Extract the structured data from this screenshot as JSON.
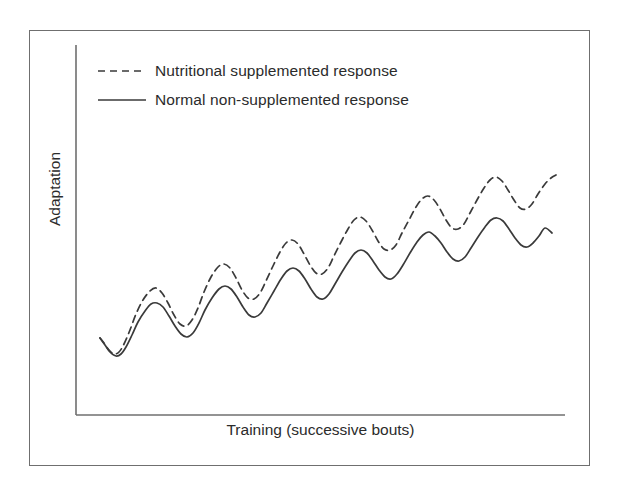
{
  "figure": {
    "border_color": "#6f6f6f",
    "background": "#ffffff"
  },
  "axes": {
    "line_color": "#6f6f6f",
    "x_label": "Training (successive bouts)",
    "y_label": "Adaptation"
  },
  "legend": {
    "entries": [
      {
        "label": "Nutritional supplemented response",
        "style": "dashed"
      },
      {
        "label": "Normal non-supplemented response",
        "style": "solid"
      }
    ]
  },
  "chart_data": {
    "type": "line",
    "title": "",
    "xlabel": "Training (successive bouts)",
    "ylabel": "Adaptation",
    "xlim": [
      0,
      100
    ],
    "ylim": [
      0,
      100
    ],
    "grid": false,
    "axis_ticks": false,
    "legend_position": "top-left",
    "line_color": "#3a3a3a",
    "series": [
      {
        "name": "Nutritional supplemented response",
        "style": "dashed",
        "points": [
          [
            100,
            338
          ],
          [
            104,
            343
          ],
          [
            109,
            350
          ],
          [
            114,
            354
          ],
          [
            119,
            352
          ],
          [
            124,
            344
          ],
          [
            130,
            330
          ],
          [
            136,
            314
          ],
          [
            143,
            300
          ],
          [
            150,
            291
          ],
          [
            156,
            288
          ],
          [
            162,
            293
          ],
          [
            168,
            303
          ],
          [
            174,
            315
          ],
          [
            180,
            324
          ],
          [
            186,
            326
          ],
          [
            192,
            320
          ],
          [
            198,
            308
          ],
          [
            204,
            292
          ],
          [
            211,
            277
          ],
          [
            218,
            267
          ],
          [
            224,
            264
          ],
          [
            230,
            268
          ],
          [
            236,
            278
          ],
          [
            242,
            290
          ],
          [
            248,
            298
          ],
          [
            254,
            299
          ],
          [
            260,
            293
          ],
          [
            266,
            281
          ],
          [
            273,
            266
          ],
          [
            280,
            252
          ],
          [
            286,
            243
          ],
          [
            292,
            240
          ],
          [
            298,
            244
          ],
          [
            304,
            254
          ],
          [
            310,
            265
          ],
          [
            316,
            273
          ],
          [
            322,
            274
          ],
          [
            328,
            268
          ],
          [
            334,
            256
          ],
          [
            341,
            242
          ],
          [
            348,
            229
          ],
          [
            354,
            220
          ],
          [
            360,
            217
          ],
          [
            366,
            221
          ],
          [
            372,
            230
          ],
          [
            378,
            241
          ],
          [
            384,
            249
          ],
          [
            390,
            250
          ],
          [
            396,
            245
          ],
          [
            402,
            233
          ],
          [
            409,
            220
          ],
          [
            416,
            207
          ],
          [
            422,
            199
          ],
          [
            428,
            196
          ],
          [
            434,
            200
          ],
          [
            440,
            209
          ],
          [
            446,
            220
          ],
          [
            452,
            228
          ],
          [
            458,
            229
          ],
          [
            464,
            224
          ],
          [
            470,
            213
          ],
          [
            477,
            200
          ],
          [
            484,
            188
          ],
          [
            490,
            180
          ],
          [
            496,
            177
          ],
          [
            502,
            181
          ],
          [
            508,
            190
          ],
          [
            514,
            200
          ],
          [
            520,
            208
          ],
          [
            526,
            209
          ],
          [
            532,
            204
          ],
          [
            538,
            194
          ],
          [
            545,
            184
          ],
          [
            551,
            178
          ],
          [
            556,
            175
          ]
        ]
      },
      {
        "name": "Normal non-supplemented response",
        "style": "solid",
        "points": [
          [
            100,
            338
          ],
          [
            105,
            345
          ],
          [
            110,
            352
          ],
          [
            116,
            356
          ],
          [
            121,
            354
          ],
          [
            126,
            347
          ],
          [
            132,
            335
          ],
          [
            138,
            322
          ],
          [
            145,
            311
          ],
          [
            151,
            304
          ],
          [
            157,
            303
          ],
          [
            163,
            307
          ],
          [
            169,
            316
          ],
          [
            175,
            326
          ],
          [
            181,
            334
          ],
          [
            187,
            337
          ],
          [
            193,
            333
          ],
          [
            199,
            323
          ],
          [
            205,
            310
          ],
          [
            212,
            298
          ],
          [
            219,
            289
          ],
          [
            225,
            286
          ],
          [
            231,
            289
          ],
          [
            237,
            297
          ],
          [
            243,
            307
          ],
          [
            249,
            315
          ],
          [
            255,
            317
          ],
          [
            261,
            313
          ],
          [
            267,
            303
          ],
          [
            274,
            291
          ],
          [
            281,
            279
          ],
          [
            287,
            271
          ],
          [
            293,
            268
          ],
          [
            299,
            271
          ],
          [
            305,
            279
          ],
          [
            311,
            289
          ],
          [
            317,
            297
          ],
          [
            323,
            299
          ],
          [
            329,
            294
          ],
          [
            335,
            284
          ],
          [
            342,
            272
          ],
          [
            349,
            261
          ],
          [
            355,
            253
          ],
          [
            361,
            250
          ],
          [
            367,
            253
          ],
          [
            373,
            261
          ],
          [
            379,
            270
          ],
          [
            385,
            277
          ],
          [
            391,
            279
          ],
          [
            397,
            274
          ],
          [
            403,
            265
          ],
          [
            410,
            253
          ],
          [
            417,
            242
          ],
          [
            423,
            235
          ],
          [
            429,
            232
          ],
          [
            435,
            236
          ],
          [
            441,
            243
          ],
          [
            447,
            252
          ],
          [
            453,
            259
          ],
          [
            459,
            261
          ],
          [
            465,
            257
          ],
          [
            471,
            248
          ],
          [
            478,
            237
          ],
          [
            485,
            227
          ],
          [
            491,
            220
          ],
          [
            497,
            218
          ],
          [
            503,
            221
          ],
          [
            509,
            229
          ],
          [
            515,
            238
          ],
          [
            521,
            245
          ],
          [
            527,
            247
          ],
          [
            533,
            243
          ],
          [
            539,
            236
          ],
          [
            545,
            228
          ],
          [
            552,
            233
          ]
        ]
      }
    ]
  }
}
